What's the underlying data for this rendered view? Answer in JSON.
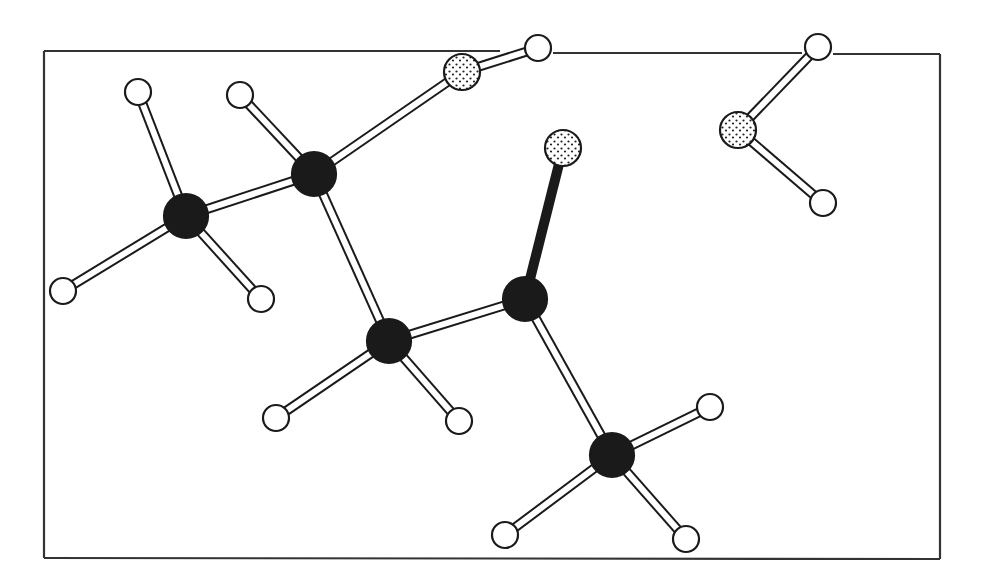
{
  "diagram": {
    "type": "ball-and-stick molecular model",
    "frame": {
      "segments": [
        {
          "x1": 44,
          "y1": 51,
          "x2": 500,
          "y2": 51
        },
        {
          "x1": 553,
          "y1": 53,
          "x2": 802,
          "y2": 53
        },
        {
          "x1": 833,
          "y1": 54,
          "x2": 940,
          "y2": 54
        },
        {
          "x1": 940,
          "y1": 54,
          "x2": 940,
          "y2": 559
        },
        {
          "x1": 940,
          "y1": 559,
          "x2": 44,
          "y2": 558
        },
        {
          "x1": 44,
          "y1": 558,
          "x2": 44,
          "y2": 51
        }
      ]
    },
    "legend": {
      "carbon": {
        "fill": "#1a1a1a",
        "style": "solid",
        "radius": 22
      },
      "oxygen": {
        "fill": "#ffffff",
        "style": "stippled",
        "radius": 18
      },
      "hydrogen": {
        "fill": "#ffffff",
        "style": "open",
        "radius": 13
      }
    },
    "atoms": [
      {
        "id": "C1",
        "element": "carbon",
        "x": 186,
        "y": 216
      },
      {
        "id": "C2",
        "element": "carbon",
        "x": 314,
        "y": 174
      },
      {
        "id": "C3",
        "element": "carbon",
        "x": 389,
        "y": 341
      },
      {
        "id": "C4",
        "element": "carbon",
        "x": 525,
        "y": 299
      },
      {
        "id": "C5",
        "element": "carbon",
        "x": 612,
        "y": 455
      },
      {
        "id": "O1",
        "element": "oxygen",
        "x": 462,
        "y": 72
      },
      {
        "id": "O2",
        "element": "oxygen",
        "x": 563,
        "y": 148
      },
      {
        "id": "O3",
        "element": "oxygen",
        "x": 738,
        "y": 130
      },
      {
        "id": "H1",
        "element": "hydrogen",
        "x": 138,
        "y": 92
      },
      {
        "id": "H2",
        "element": "hydrogen",
        "x": 63,
        "y": 291
      },
      {
        "id": "H3",
        "element": "hydrogen",
        "x": 261,
        "y": 299
      },
      {
        "id": "H4",
        "element": "hydrogen",
        "x": 240,
        "y": 95
      },
      {
        "id": "H5",
        "element": "hydrogen",
        "x": 538,
        "y": 48
      },
      {
        "id": "H6",
        "element": "hydrogen",
        "x": 276,
        "y": 418
      },
      {
        "id": "H7",
        "element": "hydrogen",
        "x": 459,
        "y": 421
      },
      {
        "id": "H8",
        "element": "hydrogen",
        "x": 710,
        "y": 407
      },
      {
        "id": "H9",
        "element": "hydrogen",
        "x": 505,
        "y": 535
      },
      {
        "id": "H10",
        "element": "hydrogen",
        "x": 686,
        "y": 539
      },
      {
        "id": "H11",
        "element": "hydrogen",
        "x": 818,
        "y": 47
      },
      {
        "id": "H12",
        "element": "hydrogen",
        "x": 823,
        "y": 203
      }
    ],
    "bonds": [
      {
        "a": "C1",
        "b": "H1",
        "style": "open"
      },
      {
        "a": "C1",
        "b": "H2",
        "style": "open"
      },
      {
        "a": "C1",
        "b": "H3",
        "style": "open"
      },
      {
        "a": "C1",
        "b": "C2",
        "style": "open"
      },
      {
        "a": "C2",
        "b": "H4",
        "style": "open"
      },
      {
        "a": "C2",
        "b": "O1",
        "style": "open"
      },
      {
        "a": "O1",
        "b": "H5",
        "style": "open"
      },
      {
        "a": "C2",
        "b": "C3",
        "style": "open"
      },
      {
        "a": "C3",
        "b": "H6",
        "style": "open"
      },
      {
        "a": "C3",
        "b": "H7",
        "style": "open"
      },
      {
        "a": "C3",
        "b": "C4",
        "style": "open"
      },
      {
        "a": "C4",
        "b": "O2",
        "style": "solid"
      },
      {
        "a": "C4",
        "b": "C5",
        "style": "open"
      },
      {
        "a": "C5",
        "b": "H8",
        "style": "open"
      },
      {
        "a": "C5",
        "b": "H9",
        "style": "open"
      },
      {
        "a": "C5",
        "b": "H10",
        "style": "open"
      },
      {
        "a": "O3",
        "b": "H11",
        "style": "open"
      },
      {
        "a": "O3",
        "b": "H12",
        "style": "open"
      }
    ]
  }
}
